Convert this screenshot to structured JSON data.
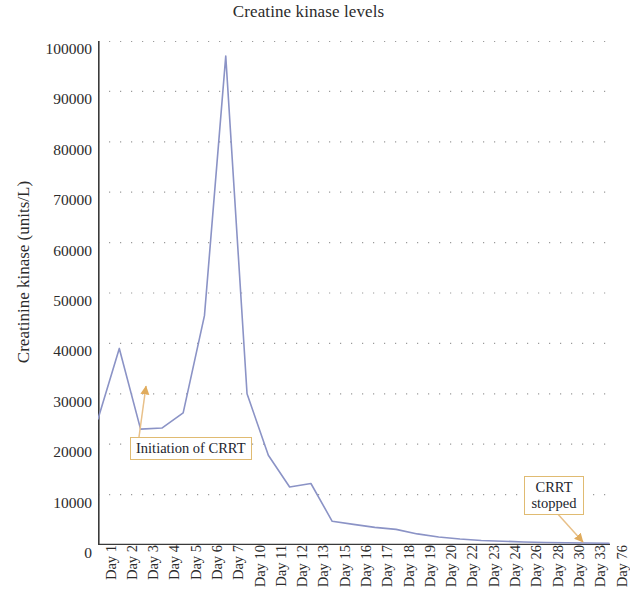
{
  "chart_data": {
    "type": "line",
    "title": "Creatine kinase levels",
    "xlabel": "",
    "ylabel": "Creatinine kinase (units/L)",
    "categories": [
      "Day 1",
      "Day 2",
      "Day 3",
      "Day 4",
      "Day 5",
      "Day 6",
      "Day 7",
      "Day 10",
      "Day 11",
      "Day 12",
      "Day 13",
      "Day 15",
      "Day 16",
      "Day 17",
      "Day 18",
      "Day 19",
      "Day 20",
      "Day 22",
      "Day 23",
      "Day 24",
      "Day 26",
      "Day 28",
      "Day 30",
      "Day 33",
      "Day 76"
    ],
    "values": [
      25000,
      39000,
      23000,
      23200,
      26200,
      45500,
      97000,
      30000,
      17800,
      11500,
      12200,
      4700,
      4100,
      3500,
      3100,
      2200,
      1600,
      1200,
      900,
      750,
      600,
      500,
      450,
      400,
      350
    ],
    "ylim": [
      0,
      100000
    ],
    "ytick_labels": [
      "100000",
      "90000",
      "80000",
      "70000",
      "60000",
      "50000",
      "40000",
      "30000",
      "20000",
      "10000",
      "0"
    ],
    "ytick_values": [
      100000,
      90000,
      80000,
      70000,
      60000,
      50000,
      40000,
      30000,
      20000,
      10000,
      0
    ],
    "grid": "horizontal-dotted",
    "legend": "none",
    "series_color": "#8b93c6",
    "annotation_color": "#e0ab5c",
    "annotations": [
      {
        "id": "initiation-of-crrt",
        "label": "Initiation of CRRT",
        "points_to_category": "Day 2",
        "points_to_value": 30000
      },
      {
        "id": "crrt-stopped",
        "label_line1": "CRRT",
        "label_line2": "stopped",
        "points_to_category": "Day 33",
        "points_to_value": 0
      }
    ]
  }
}
